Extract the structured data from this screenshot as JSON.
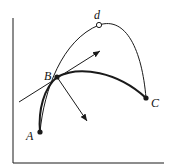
{
  "diagram": {
    "labels": {
      "A": "A",
      "B": "B",
      "C": "C",
      "d": "d"
    },
    "colors": {
      "stroke": "#1a1a1a",
      "background": "#ffffff"
    },
    "points": [
      {
        "id": "A",
        "x": 40,
        "y": 132,
        "style": "filled"
      },
      {
        "id": "B",
        "x": 57,
        "y": 77,
        "style": "filled"
      },
      {
        "id": "C",
        "x": 146,
        "y": 98,
        "style": "filled"
      },
      {
        "id": "d",
        "x": 99,
        "y": 25,
        "style": "open"
      }
    ]
  }
}
